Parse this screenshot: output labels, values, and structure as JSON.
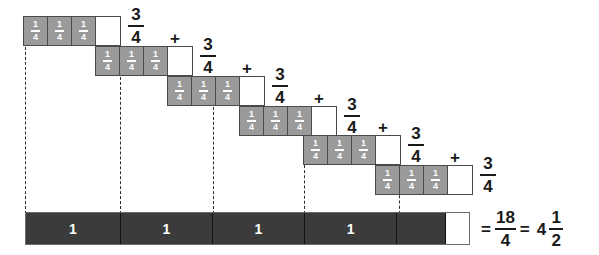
{
  "figure": {
    "colors": {
      "quarter_tile_fill": "#9a9a9a",
      "empty_tile_fill": "#ffffff",
      "tile_border": "#4a4a4a",
      "whole_bar_fill": "#3b3b3b",
      "whole_bar_border": "#6b6b6b",
      "text": "#1a1a1a",
      "tile_text": "#ffffff",
      "dashed_guide": "#2b2b2b"
    },
    "quarter_label": {
      "numerator": "1",
      "denominator": "4"
    },
    "plus_sign": "+",
    "equals_sign": "=",
    "rows": [
      {
        "id": "row-1",
        "left": 23,
        "top": 16,
        "cells": [
          "quarter",
          "quarter",
          "quarter",
          "empty"
        ],
        "sum_label": {
          "numerator": "3",
          "denominator": "4"
        },
        "has_plus": false
      },
      {
        "id": "row-2",
        "left": 95,
        "top": 46,
        "cells": [
          "quarter",
          "quarter",
          "quarter",
          "empty"
        ],
        "sum_label": {
          "numerator": "3",
          "denominator": "4"
        },
        "has_plus": true
      },
      {
        "id": "row-3",
        "left": 167,
        "top": 76,
        "cells": [
          "quarter",
          "quarter",
          "quarter",
          "empty"
        ],
        "sum_label": {
          "numerator": "3",
          "denominator": "4"
        },
        "has_plus": true
      },
      {
        "id": "row-4",
        "left": 239,
        "top": 106,
        "cells": [
          "quarter",
          "quarter",
          "quarter",
          "empty"
        ],
        "sum_label": {
          "numerator": "3",
          "denominator": "4"
        },
        "has_plus": true
      },
      {
        "id": "row-5",
        "left": 303,
        "top": 135,
        "cells": [
          "quarter",
          "quarter",
          "quarter",
          "empty"
        ],
        "sum_label": {
          "numerator": "3",
          "denominator": "4"
        },
        "has_plus": true
      },
      {
        "id": "row-6",
        "left": 375,
        "top": 165,
        "cells": [
          "quarter",
          "quarter",
          "quarter",
          "empty"
        ],
        "sum_label": {
          "numerator": "3",
          "denominator": "4"
        },
        "has_plus": true
      }
    ],
    "dashed_guides": [
      {
        "x": 25,
        "top": 42,
        "height": 172
      },
      {
        "x": 120,
        "top": 72,
        "height": 142
      },
      {
        "x": 213,
        "top": 102,
        "height": 112
      },
      {
        "x": 304,
        "top": 160,
        "height": 54
      },
      {
        "x": 399,
        "top": 190,
        "height": 24
      }
    ],
    "whole_bar": {
      "segments": [
        {
          "label": "1",
          "width": 95,
          "kind": "whole"
        },
        {
          "label": "1",
          "width": 93,
          "kind": "whole"
        },
        {
          "label": "1",
          "width": 92,
          "kind": "whole"
        },
        {
          "label": "1",
          "width": 93,
          "kind": "whole"
        },
        {
          "label": "",
          "width": 49,
          "kind": "half"
        },
        {
          "label": "",
          "width": 23,
          "kind": "empty"
        }
      ]
    },
    "equation": {
      "equals_1": "=",
      "improper_fraction": {
        "numerator": "18",
        "denominator": "4"
      },
      "equals_2": "=",
      "mixed_whole": "4",
      "mixed_fraction": {
        "numerator": "1",
        "denominator": "2"
      }
    }
  },
  "chart_data": {
    "type": "bar",
    "categories": [
      "Group 1",
      "Group 2",
      "Group 3",
      "Group 4",
      "Group 5",
      "Group 6"
    ],
    "values": [
      0.75,
      0.75,
      0.75,
      0.75,
      0.75,
      0.75
    ],
    "unit": "1/4 tile",
    "tiles_per_group": 3,
    "tile_value": 0.25,
    "total_quarters": 18,
    "total_improper": "18/4",
    "total_mixed": "4 1/2",
    "whole_units_shown": 4,
    "xlabel": "",
    "ylabel": "",
    "grid": false,
    "legend": "none"
  }
}
